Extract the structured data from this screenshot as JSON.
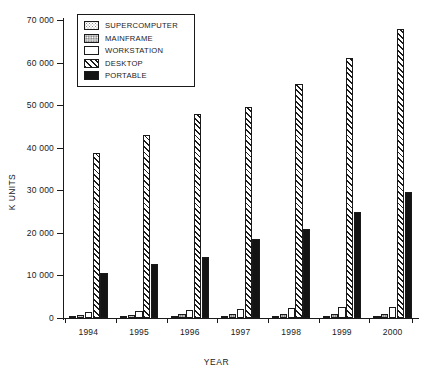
{
  "chart_data": {
    "type": "bar",
    "title": "",
    "xlabel": "YEAR",
    "ylabel": "K UNITS",
    "categories": [
      "1994",
      "1995",
      "1996",
      "1997",
      "1998",
      "1999",
      "2000"
    ],
    "ylim": [
      0,
      70000
    ],
    "yticks": [
      0,
      10000,
      20000,
      30000,
      40000,
      50000,
      60000,
      70000
    ],
    "ytick_labels": [
      "0",
      "10 000",
      "20 000",
      "30 000",
      "40 000",
      "50 000",
      "60 000",
      "70 000"
    ],
    "grid": false,
    "legend_position": "top-left",
    "series": [
      {
        "name": "SUPERCOMPUTER",
        "pattern": "light-dotted",
        "values": [
          300,
          350,
          400,
          420,
          450,
          480,
          500
        ]
      },
      {
        "name": "MAINFRAME",
        "pattern": "gray-dotted",
        "values": [
          800,
          820,
          850,
          880,
          900,
          930,
          950
        ]
      },
      {
        "name": "WORKSTATION",
        "pattern": "white-empty",
        "values": [
          1500,
          1700,
          1900,
          2100,
          2300,
          2500,
          2700
        ]
      },
      {
        "name": "DESKTOP",
        "pattern": "diagonal-hatch",
        "values": [
          38800,
          43000,
          48000,
          49500,
          55000,
          61000,
          67800
        ]
      },
      {
        "name": "PORTABLE",
        "pattern": "solid-black",
        "values": [
          10600,
          12800,
          14400,
          18500,
          20800,
          25000,
          29500
        ]
      }
    ]
  },
  "legend": {
    "items": [
      {
        "label": "SUPERCOMPUTER"
      },
      {
        "label": "MAINFRAME"
      },
      {
        "label": "WORKSTATION"
      },
      {
        "label": "DESKTOP"
      },
      {
        "label": "PORTABLE"
      }
    ]
  },
  "colors": {
    "axis": "#1a1a1a",
    "background": "#ffffff",
    "portable_fill": "#141414",
    "mainframe_fill": "#bdbdbd"
  }
}
